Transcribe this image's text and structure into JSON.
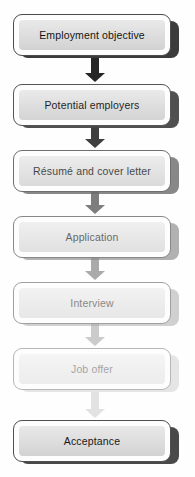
{
  "figure": {
    "kind": "flowchart",
    "orientation": "vertical-top-to-bottom",
    "clipped_heading_remnant": "",
    "background_color": "#fefefe",
    "text_color": "#141414",
    "node_stroke_color": "#4c4c4c",
    "node_fill_top": "#e9e9e9",
    "node_fill_bottom": "#d2d2d2"
  },
  "steps": [
    {
      "index": 1,
      "label": "Employment objective",
      "top": 14,
      "ink": 1.0,
      "shadow_color": "#3c3c3c"
    },
    {
      "index": 2,
      "label": "Potential employers",
      "top": 84,
      "ink": 0.95,
      "shadow_color": "#474747"
    },
    {
      "index": 3,
      "label": "Résumé and cover letter",
      "top": 150,
      "ink": 0.8,
      "shadow_color": "#6b6b6b"
    },
    {
      "index": 4,
      "label": "Application",
      "top": 216,
      "ink": 0.66,
      "shadow_color": "#8a8a8a"
    },
    {
      "index": 5,
      "label": "Interview",
      "top": 282,
      "ink": 0.52,
      "shadow_color": "#a8a8a8"
    },
    {
      "index": 6,
      "label": "Job offer",
      "top": 348,
      "ink": 0.4,
      "shadow_color": "#c2c2c2"
    },
    {
      "index": 7,
      "label": "Acceptance",
      "top": 420,
      "ink": 0.98,
      "shadow_color": "#464646"
    }
  ],
  "connectors": [
    {
      "from": 1,
      "to": 2,
      "top": 58,
      "height": 24,
      "color": "#262626",
      "ink": 1.0
    },
    {
      "from": 2,
      "to": 3,
      "top": 126,
      "height": 22,
      "color": "#2f2f2f",
      "ink": 0.92
    },
    {
      "from": 3,
      "to": 4,
      "top": 192,
      "height": 22,
      "color": "#555555",
      "ink": 0.76
    },
    {
      "from": 4,
      "to": 5,
      "top": 258,
      "height": 22,
      "color": "#777777",
      "ink": 0.62
    },
    {
      "from": 5,
      "to": 6,
      "top": 324,
      "height": 22,
      "color": "#9a9a9a",
      "ink": 0.5
    },
    {
      "from": 6,
      "to": 7,
      "top": 392,
      "height": 26,
      "color": "#b9b9b9",
      "ink": 0.4
    }
  ]
}
